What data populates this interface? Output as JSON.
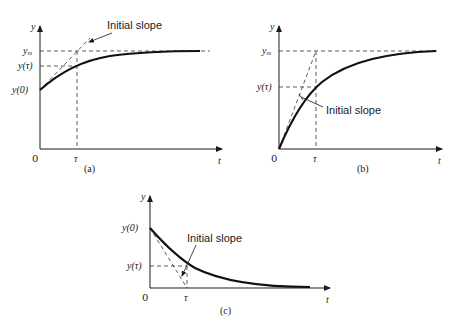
{
  "figure": {
    "panels": [
      {
        "id": "a",
        "caption": "(a)",
        "y_axis_label": "y",
        "x_axis_label": "t",
        "origin_label": "0",
        "y_tick_labels": [
          "y_ss",
          "y(τ)",
          "y(0)"
        ],
        "y_ss_label": "y",
        "y_ss_sub": "ss",
        "y_tau_label": "y(τ)",
        "y0_label": "y(0)",
        "x_tick_label": "τ",
        "annotation": "Initial slope",
        "description": "Rising first-order response starting from nonzero y(0), approaching y_ss"
      },
      {
        "id": "b",
        "caption": "(b)",
        "y_axis_label": "y",
        "x_axis_label": "t",
        "origin_label": "0",
        "y_ss_label": "y",
        "y_ss_sub": "ss",
        "y_tau_label": "y(τ)",
        "x_tick_label": "τ",
        "annotation": "Initial slope",
        "description": "Rising first-order response starting from zero, approaching y_ss"
      },
      {
        "id": "c",
        "caption": "(c)",
        "y_axis_label": "y",
        "x_axis_label": "t",
        "origin_label": "0",
        "y0_label": "y(0)",
        "y_tau_label": "y(τ)",
        "x_tick_label": "τ",
        "annotation": "Initial slope",
        "description": "Decaying first-order response from y(0) toward zero"
      }
    ]
  }
}
